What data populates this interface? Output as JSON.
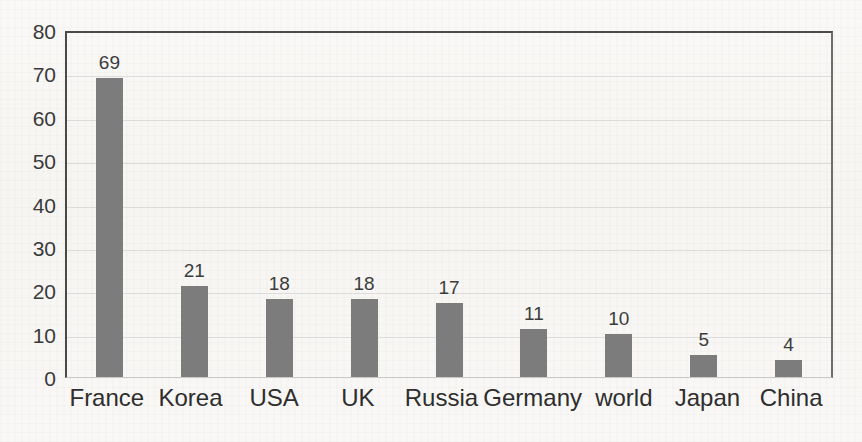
{
  "chart_data": {
    "type": "bar",
    "title": "",
    "subtitle": "",
    "xlabel": "",
    "ylabel": "",
    "categories": [
      "France",
      "Korea",
      "USA",
      "UK",
      "Russia",
      "Germany",
      "world",
      "Japan",
      "China"
    ],
    "values": [
      69,
      21,
      18,
      18,
      17,
      11,
      10,
      5,
      4
    ],
    "data_labels": [
      "69",
      "21",
      "18",
      "18",
      "17",
      "11",
      "10",
      "5",
      "4"
    ],
    "ylim": [
      0,
      80
    ],
    "ytick_values": [
      80,
      70,
      60,
      50,
      40,
      30,
      20,
      10,
      0
    ],
    "ytick_labels": [
      "80",
      "70",
      "60",
      "50",
      "40",
      "30",
      "20",
      "10",
      "0"
    ],
    "grid": "horizontal",
    "legend": "none",
    "series": [
      {
        "name": "",
        "values": [
          69,
          21,
          18,
          18,
          17,
          11,
          10,
          5,
          4
        ]
      }
    ]
  },
  "colors": {
    "bar_fill": "#7c7c7c",
    "gridline": "#dcdcdc",
    "axis_line": "#4a4a4a",
    "tick_text": "#3a3a3a",
    "label_text": "#2e2e2e",
    "value_text": "#3c3c3c",
    "page_background": "#f8f7f5"
  }
}
